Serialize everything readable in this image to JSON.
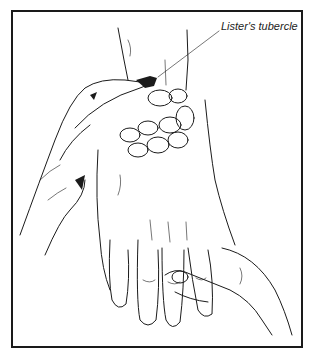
{
  "figure": {
    "label": "Lister's tubercle",
    "colors": {
      "line": "#1b1b1b",
      "background": "#ffffff",
      "border": "#1a1a1a"
    }
  }
}
